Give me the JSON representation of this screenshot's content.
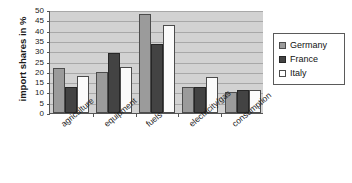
{
  "chart_data": {
    "type": "bar",
    "title": "",
    "subtitle": "",
    "xlabel": "",
    "ylabel": "import shares in %",
    "ylim": [
      0,
      50
    ],
    "ytick_step": 5,
    "yticks": [
      0,
      5,
      10,
      15,
      20,
      25,
      30,
      35,
      40,
      45,
      50
    ],
    "ytick_labels": [
      "0",
      "5",
      "10",
      "15",
      "20",
      "25",
      "30",
      "35",
      "40",
      "45",
      "50"
    ],
    "grid": true,
    "grid_axis": "y",
    "legend_position": "right",
    "categories": [
      "agriculture",
      "equipment",
      "fuels",
      "electricity/gas",
      "consumption"
    ],
    "series": [
      {
        "name": "Germany",
        "color": "#9b9b9b",
        "values": [
          22,
          20,
          48,
          12.5,
          10
        ]
      },
      {
        "name": "France",
        "color": "#434343",
        "values": [
          12.5,
          29,
          33.5,
          12.5,
          11
        ]
      },
      {
        "name": "Italy",
        "color": "#ffffff",
        "values": [
          18,
          22.5,
          42.5,
          17.5,
          11
        ]
      }
    ],
    "plot_background": "#d2d2d2",
    "axis_color": "#555555",
    "gridline_color": "#a8a8a8"
  },
  "legend": {
    "items": [
      {
        "label": "Germany"
      },
      {
        "label": "France"
      },
      {
        "label": "Italy"
      }
    ]
  }
}
